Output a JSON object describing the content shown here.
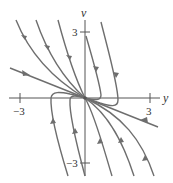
{
  "diagram": {
    "type": "phase-portrait",
    "axes": {
      "x_label": "y",
      "y_label": "v",
      "x_ticks": [
        {
          "value": -3,
          "label": "−3"
        },
        {
          "value": 3,
          "label": "3"
        }
      ],
      "y_ticks": [
        {
          "value": 3,
          "label": "3"
        },
        {
          "value": -3,
          "label": "−3"
        }
      ],
      "range": {
        "x": [
          -3.5,
          3.7
        ],
        "y": [
          -3.5,
          3.7
        ]
      }
    },
    "straight_line_solution": {
      "slope": -0.4,
      "direction": "toward origin"
    },
    "curves_count": 9,
    "equilibrium": {
      "y": 0,
      "v": 0,
      "type": "stable node"
    }
  }
}
